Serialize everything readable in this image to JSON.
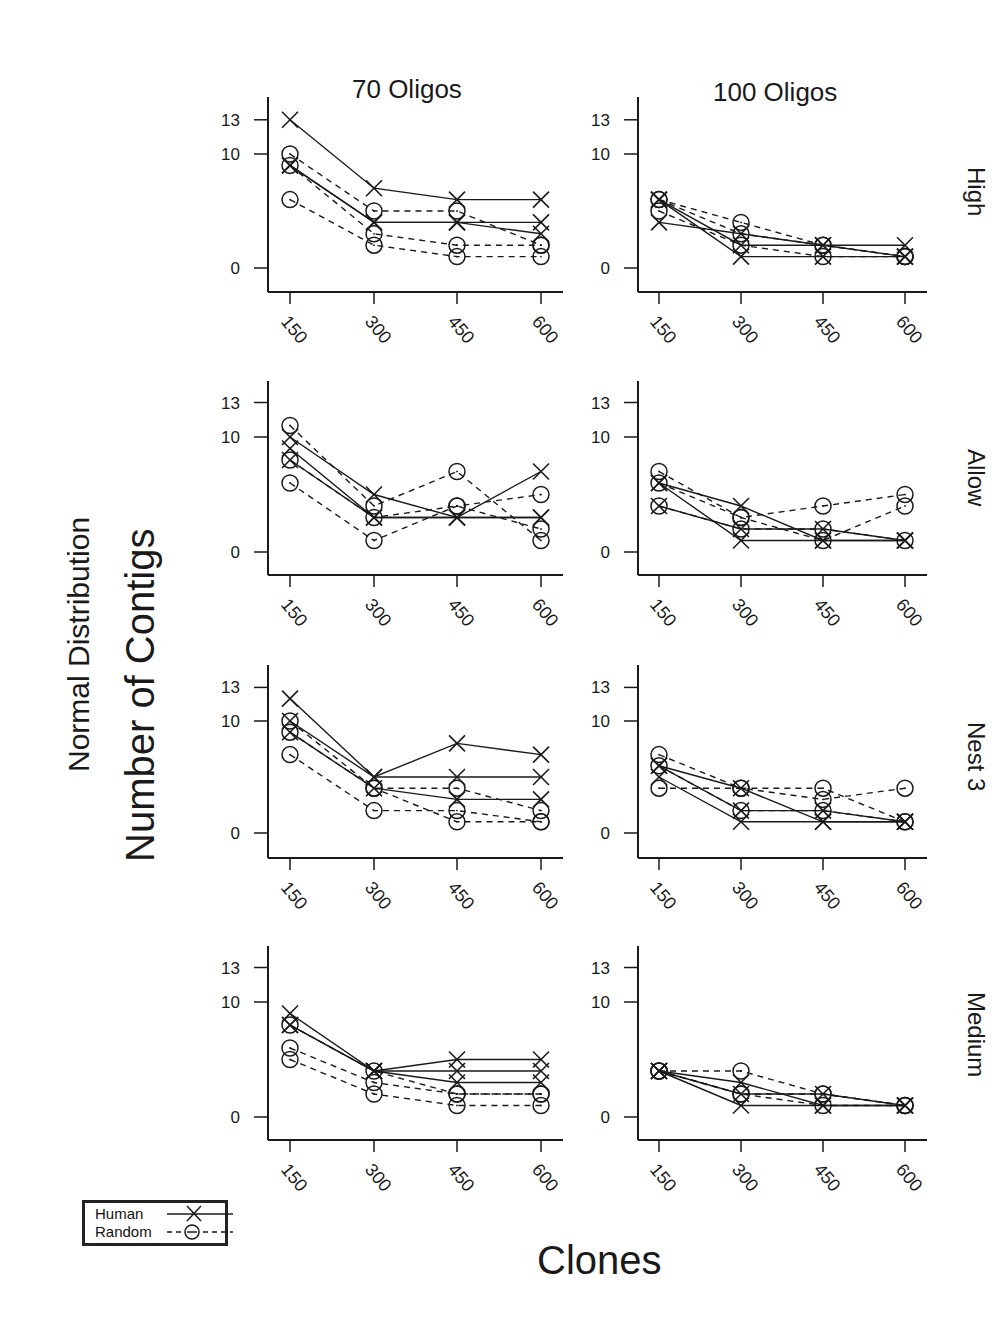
{
  "figure": {
    "ylabel_line1": "Normal Distribution",
    "ylabel_line2": "Number of Contigs",
    "xlabel": "Clones",
    "columns": [
      "70 Oligos",
      "100 Oligos"
    ],
    "rows": [
      "High",
      "Allow",
      "Nest 3",
      "Medium"
    ],
    "legend": [
      {
        "label": "Human",
        "marker": "x",
        "line": "solid"
      },
      {
        "label": "Random",
        "marker": "circle",
        "line": "dashed"
      }
    ],
    "colors": {
      "ink": "#1a1a1a",
      "background": "#ffffff"
    }
  },
  "chart_data": [
    {
      "type": "line",
      "title": "High / 70 Oligos",
      "row": "High",
      "column": "70 Oligos",
      "xlabel": "Clones",
      "ylabel": "Number of Contigs",
      "x": [
        150,
        300,
        450,
        600
      ],
      "yticks": [
        0,
        10,
        13
      ],
      "ylim": [
        -2,
        15
      ],
      "grid": false,
      "series": [
        {
          "name": "Human",
          "values": [
            13,
            7,
            6,
            6
          ]
        },
        {
          "name": "Human",
          "values": [
            9,
            4,
            4,
            4
          ]
        },
        {
          "name": "Human",
          "values": [
            9,
            4,
            4,
            3
          ]
        },
        {
          "name": "Random",
          "values": [
            10,
            5,
            5,
            2
          ]
        },
        {
          "name": "Random",
          "values": [
            6,
            2,
            1,
            1
          ]
        },
        {
          "name": "Random",
          "values": [
            9,
            3,
            2,
            2
          ]
        }
      ]
    },
    {
      "type": "line",
      "title": "High / 100 Oligos",
      "row": "High",
      "column": "100 Oligos",
      "xlabel": "Clones",
      "ylabel": "Number of Contigs",
      "x": [
        150,
        300,
        450,
        600
      ],
      "yticks": [
        0,
        10,
        13
      ],
      "ylim": [
        -2,
        15
      ],
      "grid": false,
      "series": [
        {
          "name": "Human",
          "values": [
            6,
            1,
            1,
            1
          ]
        },
        {
          "name": "Human",
          "values": [
            4,
            3,
            2,
            2
          ]
        },
        {
          "name": "Human",
          "values": [
            6,
            2,
            2,
            1
          ]
        },
        {
          "name": "Random",
          "values": [
            6,
            4,
            2,
            1
          ]
        },
        {
          "name": "Random",
          "values": [
            5,
            2,
            1,
            1
          ]
        },
        {
          "name": "Random",
          "values": [
            6,
            3,
            2,
            1
          ]
        }
      ]
    },
    {
      "type": "line",
      "title": "Allow / 70 Oligos",
      "row": "Allow",
      "column": "70 Oligos",
      "xlabel": "Clones",
      "ylabel": "Number of Contigs",
      "x": [
        150,
        300,
        450,
        600
      ],
      "yticks": [
        0,
        10,
        13
      ],
      "ylim": [
        -2,
        15
      ],
      "grid": false,
      "series": [
        {
          "name": "Human",
          "values": [
            10,
            5,
            3,
            7
          ]
        },
        {
          "name": "Human",
          "values": [
            9,
            3,
            3,
            3
          ]
        },
        {
          "name": "Human",
          "values": [
            8,
            3,
            3,
            3
          ]
        },
        {
          "name": "Random",
          "values": [
            11,
            4,
            7,
            1
          ]
        },
        {
          "name": "Random",
          "values": [
            6,
            1,
            4,
            5
          ]
        },
        {
          "name": "Random",
          "values": [
            8,
            3,
            4,
            2
          ]
        }
      ]
    },
    {
      "type": "line",
      "title": "Allow / 100 Oligos",
      "row": "Allow",
      "column": "100 Oligos",
      "xlabel": "Clones",
      "ylabel": "Number of Contigs",
      "x": [
        150,
        300,
        450,
        600
      ],
      "yticks": [
        0,
        10,
        13
      ],
      "ylim": [
        -2,
        15
      ],
      "grid": false,
      "series": [
        {
          "name": "Human",
          "values": [
            6,
            4,
            1,
            1
          ]
        },
        {
          "name": "Human",
          "values": [
            6,
            1,
            1,
            1
          ]
        },
        {
          "name": "Human",
          "values": [
            4,
            2,
            2,
            1
          ]
        },
        {
          "name": "Random",
          "values": [
            7,
            3,
            4,
            5
          ]
        },
        {
          "name": "Random",
          "values": [
            6,
            3,
            1,
            4
          ]
        },
        {
          "name": "Random",
          "values": [
            4,
            2,
            2,
            1
          ]
        }
      ]
    },
    {
      "type": "line",
      "title": "Nest 3 / 70 Oligos",
      "row": "Nest 3",
      "column": "70 Oligos",
      "xlabel": "Clones",
      "ylabel": "Number of Contigs",
      "x": [
        150,
        300,
        450,
        600
      ],
      "yticks": [
        0,
        10,
        13
      ],
      "ylim": [
        -2,
        15
      ],
      "grid": false,
      "series": [
        {
          "name": "Human",
          "values": [
            12,
            5,
            8,
            7
          ]
        },
        {
          "name": "Human",
          "values": [
            10,
            5,
            5,
            5
          ]
        },
        {
          "name": "Human",
          "values": [
            9,
            4,
            3,
            3
          ]
        },
        {
          "name": "Random",
          "values": [
            10,
            4,
            4,
            2
          ]
        },
        {
          "name": "Random",
          "values": [
            7,
            2,
            2,
            1
          ]
        },
        {
          "name": "Random",
          "values": [
            9,
            4,
            1,
            1
          ]
        }
      ]
    },
    {
      "type": "line",
      "title": "Nest 3 / 100 Oligos",
      "row": "Nest 3",
      "column": "100 Oligos",
      "xlabel": "Clones",
      "ylabel": "Number of Contigs",
      "x": [
        150,
        300,
        450,
        600
      ],
      "yticks": [
        0,
        10,
        13
      ],
      "ylim": [
        -2,
        15
      ],
      "grid": false,
      "series": [
        {
          "name": "Human",
          "values": [
            6,
            4,
            1,
            1
          ]
        },
        {
          "name": "Human",
          "values": [
            5,
            1,
            1,
            1
          ]
        },
        {
          "name": "Human",
          "values": [
            6,
            2,
            2,
            1
          ]
        },
        {
          "name": "Random",
          "values": [
            7,
            4,
            4,
            1
          ]
        },
        {
          "name": "Random",
          "values": [
            4,
            4,
            3,
            4
          ]
        },
        {
          "name": "Random",
          "values": [
            6,
            2,
            2,
            1
          ]
        }
      ]
    },
    {
      "type": "line",
      "title": "Medium / 70 Oligos",
      "row": "Medium",
      "column": "70 Oligos",
      "xlabel": "Clones",
      "ylabel": "Number of Contigs",
      "x": [
        150,
        300,
        450,
        600
      ],
      "yticks": [
        0,
        10,
        13
      ],
      "ylim": [
        -2,
        15
      ],
      "grid": false,
      "series": [
        {
          "name": "Human",
          "values": [
            9,
            4,
            5,
            5
          ]
        },
        {
          "name": "Human",
          "values": [
            8,
            4,
            4,
            4
          ]
        },
        {
          "name": "Human",
          "values": [
            8,
            4,
            3,
            3
          ]
        },
        {
          "name": "Random",
          "values": [
            6,
            3,
            2,
            2
          ]
        },
        {
          "name": "Random",
          "values": [
            5,
            2,
            1,
            1
          ]
        },
        {
          "name": "Random",
          "values": [
            8,
            4,
            2,
            2
          ]
        }
      ]
    },
    {
      "type": "line",
      "title": "Medium / 100 Oligos",
      "row": "Medium",
      "column": "100 Oligos",
      "xlabel": "Clones",
      "ylabel": "Number of Contigs",
      "x": [
        150,
        300,
        450,
        600
      ],
      "yticks": [
        0,
        10,
        13
      ],
      "ylim": [
        -2,
        15
      ],
      "grid": false,
      "series": [
        {
          "name": "Human",
          "values": [
            4,
            1,
            1,
            1
          ]
        },
        {
          "name": "Human",
          "values": [
            4,
            2,
            2,
            1
          ]
        },
        {
          "name": "Human",
          "values": [
            4,
            3,
            1,
            1
          ]
        },
        {
          "name": "Random",
          "values": [
            4,
            4,
            2,
            1
          ]
        },
        {
          "name": "Random",
          "values": [
            4,
            2,
            2,
            1
          ]
        },
        {
          "name": "Random",
          "values": [
            4,
            2,
            1,
            1
          ]
        }
      ]
    }
  ]
}
